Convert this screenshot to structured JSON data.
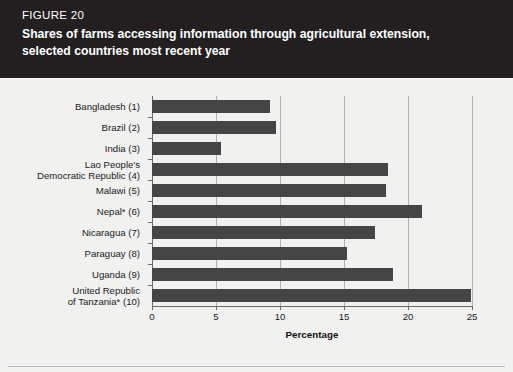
{
  "header": {
    "figure_number": "FIGURE 20",
    "title": "Shares of farms accessing information through agricultural extension, selected countries most recent year",
    "background_color": "#231f20",
    "text_color": "#ffffff"
  },
  "chart_data": {
    "type": "bar",
    "orientation": "horizontal",
    "title": "Shares of farms accessing information through agricultural extension, selected countries most recent year",
    "xlabel": "Percentage",
    "ylabel": "",
    "xlim": [
      0,
      25
    ],
    "xticks": [
      0,
      5,
      10,
      15,
      20,
      25
    ],
    "xtick_labels": [
      "0",
      "5",
      "10",
      "15",
      "20",
      "25"
    ],
    "grid": true,
    "grid_axis": "x",
    "legend": null,
    "bar_color": "#454545",
    "plot_background": "#f1f1ef",
    "categories": [
      "Bangladesh (1)",
      "Brazil (2)",
      "India (3)",
      "Lao People's\nDemocratic Republic (4)",
      "Malawi (5)",
      "Nepal* (6)",
      "Nicaragua (7)",
      "Paraguay (8)",
      "Uganda (9)",
      "United Republic\nof Tanzania* (10)"
    ],
    "values": [
      9.2,
      9.7,
      5.4,
      18.4,
      18.3,
      21.1,
      17.4,
      15.2,
      18.8,
      24.9
    ],
    "bars": [
      {
        "label_line1": "Bangladesh (1)",
        "label_line2": "",
        "value": 9.2
      },
      {
        "label_line1": "Brazil (2)",
        "label_line2": "",
        "value": 9.7
      },
      {
        "label_line1": "India (3)",
        "label_line2": "",
        "value": 5.4
      },
      {
        "label_line1": "Lao People's",
        "label_line2": "Democratic Republic (4)",
        "value": 18.4
      },
      {
        "label_line1": "Malawi (5)",
        "label_line2": "",
        "value": 18.3
      },
      {
        "label_line1": "Nepal* (6)",
        "label_line2": "",
        "value": 21.1
      },
      {
        "label_line1": "Nicaragua (7)",
        "label_line2": "",
        "value": 17.4
      },
      {
        "label_line1": "Paraguay (8)",
        "label_line2": "",
        "value": 15.2
      },
      {
        "label_line1": "Uganda (9)",
        "label_line2": "",
        "value": 18.8
      },
      {
        "label_line1": "United Republic",
        "label_line2": "of Tanzania* (10)",
        "value": 24.9
      }
    ],
    "footnote_marker": "*"
  }
}
